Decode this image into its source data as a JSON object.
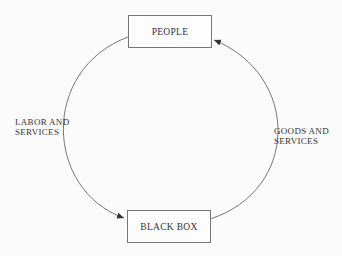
{
  "diagram": {
    "nodes": [
      {
        "id": "people",
        "label": "PEOPLE"
      },
      {
        "id": "black_box",
        "label": "BLACK BOX"
      }
    ],
    "edges": [
      {
        "from": "people",
        "to": "black_box",
        "label_line1": "LABOR AND",
        "label_line2": "SERVICES",
        "side": "left"
      },
      {
        "from": "black_box",
        "to": "people",
        "label_line1": "GOODS AND",
        "label_line2": "SERVICES",
        "side": "right"
      }
    ]
  }
}
